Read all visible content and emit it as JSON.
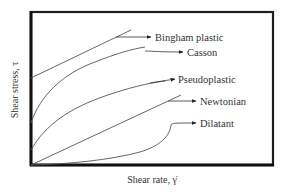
{
  "diagram": {
    "title": "",
    "x_axis_label": "Shear rate, γ̇",
    "y_axis_label": "Shear stress, τ",
    "curves": [
      {
        "id": "bingham",
        "label": "Bingham plastic",
        "shape": "straight line with positive yield stress intercept"
      },
      {
        "id": "casson",
        "label": "Casson",
        "shape": "concave-down curve with yield stress intercept"
      },
      {
        "id": "pseudoplastic",
        "label": "Pseudoplastic",
        "shape": "concave-down curve through origin"
      },
      {
        "id": "newtonian",
        "label": "Newtonian",
        "shape": "straight line through origin"
      },
      {
        "id": "dilatant",
        "label": "Dilatant",
        "shape": "concave-up curve through origin"
      }
    ]
  },
  "colors": {
    "frame": "#1e1e1e",
    "curve": "#555555",
    "text": "#333333",
    "background": "#ffffff"
  }
}
